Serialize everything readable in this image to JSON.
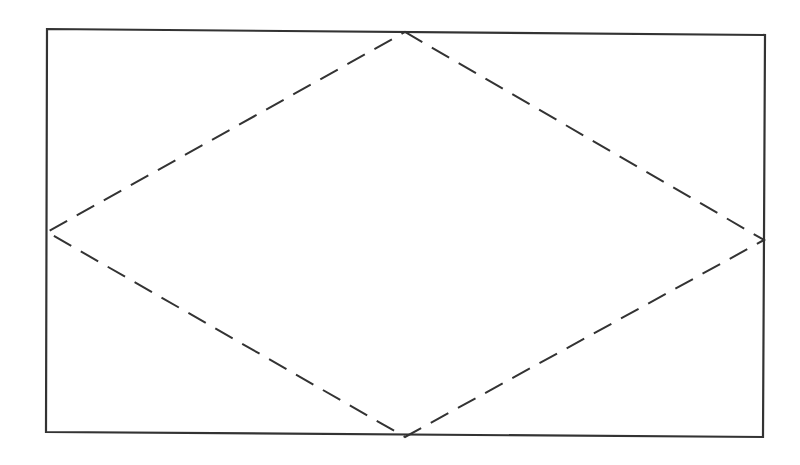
{
  "diagram": {
    "type": "rhombus-inscribed-in-rectangle",
    "stroke_color": "#333333",
    "background": "#ffffff",
    "rectangle": {
      "points": [
        [
          47,
          29
        ],
        [
          765,
          35
        ],
        [
          763,
          437
        ],
        [
          46,
          432
        ]
      ],
      "style": "solid",
      "stroke_width": 2.2
    },
    "rhombus": {
      "points": [
        [
          405,
          32
        ],
        [
          764,
          240
        ],
        [
          405,
          437
        ],
        [
          47,
          232
        ]
      ],
      "style": "dashed",
      "dash": "20 11",
      "stroke_width": 2
    }
  }
}
